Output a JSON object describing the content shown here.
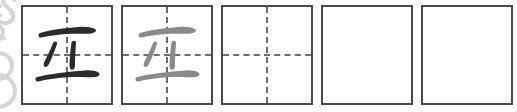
{
  "worksheet": {
    "title": "Chinese character handwriting practice row",
    "character": "立",
    "character_pinyin": "lì",
    "background_color": "#ffffff",
    "cell_border_color": "#4a4a4a",
    "guide_line_color": "#6d6d6d",
    "ink_dark_color": "#2b2b2b",
    "ink_light_color": "#8a8a8a",
    "watermark_color": "#d5d5d5",
    "cell_count": 5
  },
  "cells": [
    {
      "index": 1,
      "name": "model-character-cell",
      "glyph": "立",
      "ink": "dark",
      "ink_color": "#2b2b2b",
      "has_guides": true,
      "state": "filled"
    },
    {
      "index": 2,
      "name": "trace-character-cell",
      "glyph": "立",
      "ink": "light",
      "ink_color": "#8a8a8a",
      "has_guides": true,
      "state": "tracing-guide"
    },
    {
      "index": 3,
      "name": "empty-guided-cell",
      "glyph": "",
      "ink": "none",
      "ink_color": "",
      "has_guides": true,
      "state": "empty"
    },
    {
      "index": 4,
      "name": "empty-plain-cell",
      "glyph": "",
      "ink": "none",
      "ink_color": "",
      "has_guides": false,
      "state": "empty"
    },
    {
      "index": 5,
      "name": "empty-plain-cell",
      "glyph": "",
      "ink": "none",
      "ink_color": "",
      "has_guides": false,
      "state": "empty"
    }
  ],
  "watermark": {
    "name": "decorative-scroll-watermark",
    "description": "clipped ornamental swirl and figure-eight flourish at left margin",
    "color": "#d5d5d5"
  }
}
